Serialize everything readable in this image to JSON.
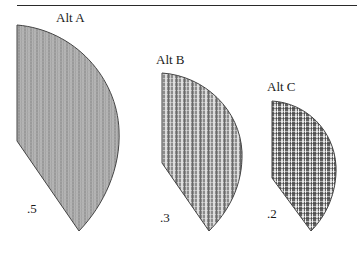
{
  "diagram": {
    "type": "probability-wedges",
    "alternatives": [
      {
        "label": "Alt A",
        "probability": ".5",
        "fill_pattern": "fine-gray-vertical-stripes"
      },
      {
        "label": "Alt B",
        "probability": ".3",
        "fill_pattern": "checked-gray-vertical-stripes"
      },
      {
        "label": "Alt C",
        "probability": ".2",
        "fill_pattern": "dark-checked-vertical-stripes"
      }
    ]
  },
  "colors": {
    "rule": "#2a2a2a",
    "outline": "#444444",
    "fill_a": "#a8a8a8",
    "fill_b": "#8e8e8e",
    "fill_c": "#6e6e6e"
  }
}
